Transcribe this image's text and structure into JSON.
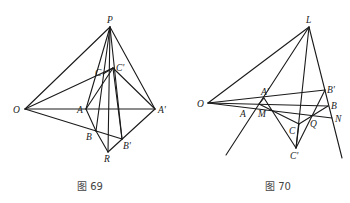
{
  "figures": [
    {
      "caption": "图 69",
      "points": {
        "P": [
          110,
          27
        ],
        "O": [
          25,
          109
        ],
        "A": [
          86,
          109
        ],
        "A'": [
          155,
          109
        ],
        "C": [
          103,
          74
        ],
        "C'": [
          113,
          68
        ],
        "B": [
          96,
          131
        ],
        "B'": [
          122,
          139
        ],
        "R": [
          108,
          152
        ]
      },
      "labels": {
        "P": "P",
        "O": "O",
        "A": "A",
        "A_prime": "A'",
        "C": "C",
        "C_prime": "C'",
        "B": "B",
        "B_prime": "B'",
        "R": "R"
      }
    },
    {
      "caption": "图 70",
      "points": {
        "L": [
          309,
          27
        ],
        "O": [
          208,
          103
        ],
        "A'": [
          264,
          98
        ],
        "A": [
          259,
          104
        ],
        "M": [
          261,
          105
        ],
        "B'": [
          325,
          90
        ],
        "B": [
          328,
          106
        ],
        "N": [
          332,
          118
        ],
        "Q": [
          312,
          116
        ],
        "C": [
          299,
          124
        ],
        "C'": [
          296,
          148
        ]
      },
      "labels": {
        "L": "L",
        "O": "O",
        "A_prime": "A'",
        "A": "A",
        "M": "M",
        "B_prime": "B'",
        "B": "B",
        "N": "N",
        "Q": "Q",
        "C": "C",
        "C_prime": "C'"
      }
    }
  ]
}
